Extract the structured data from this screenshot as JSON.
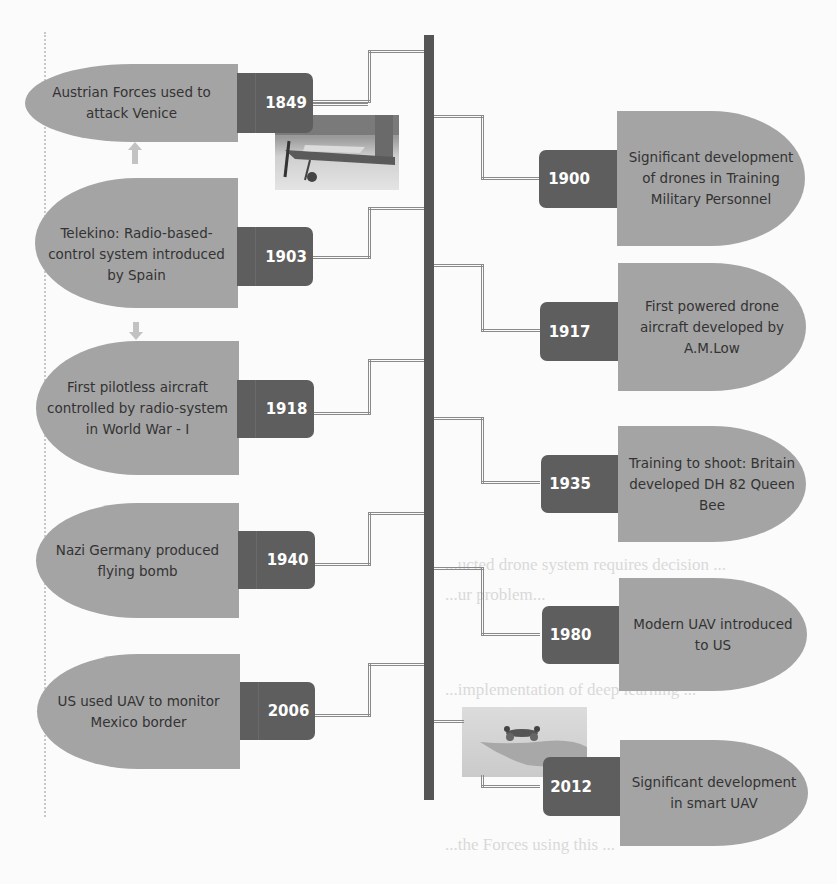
{
  "diagram": {
    "left_events": [
      {
        "year": "1849",
        "text": "Austrian Forces used to attack Venice"
      },
      {
        "year": "1903",
        "text": "Telekino: Radio-based-control system introduced by Spain"
      },
      {
        "year": "1918",
        "text": "First pilotless aircraft controlled by radio-system in World War - I"
      },
      {
        "year": "1940",
        "text": "Nazi Germany produced flying bomb"
      },
      {
        "year": "2006",
        "text": "US used UAV to monitor Mexico border"
      }
    ],
    "right_events": [
      {
        "year": "1900",
        "text": "Significant development of drones in Training Military Personnel"
      },
      {
        "year": "1917",
        "text": "First powered drone aircraft developed by A.M.Low"
      },
      {
        "year": "1935",
        "text": "Training to shoot: Britain developed DH 82 Queen Bee"
      },
      {
        "year": "1980",
        "text": "Modern UAV introduced to US"
      },
      {
        "year": "2012",
        "text": "Significant development in smart UAV"
      }
    ],
    "images": [
      {
        "name": "early-aircraft-photo",
        "near_year": "1849"
      },
      {
        "name": "drone-over-hand-photo",
        "near_year": "2012"
      }
    ],
    "colors": {
      "pill": "#a4a4a4",
      "year_box": "#5e5e5e",
      "spine": "#555555",
      "connector": "#8a8a8a",
      "year_text": "#ffffff",
      "event_text": "#333333"
    }
  },
  "background_text": [
    "...ucted drone system requires decision ...",
    "...ur problem...",
    "...ly... Deep Learning ...",
    "...implementation of deep learning ...",
    "...the Forces using this ..."
  ]
}
